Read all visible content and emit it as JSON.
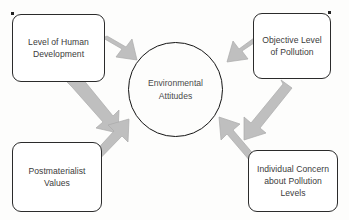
{
  "diagram": {
    "type": "influence-diagram",
    "center": {
      "id": "environmental-attitudes",
      "label": "Environmental\nAttitudes",
      "shape": "circle"
    },
    "nodes": [
      {
        "id": "human-development",
        "label": "Level of Human\nDevelopment",
        "shape": "rounded-rect",
        "position": "top-left"
      },
      {
        "id": "objective-pollution",
        "label": "Objective Level\nof Pollution",
        "shape": "rounded-rect",
        "position": "top-right"
      },
      {
        "id": "postmaterialist",
        "label": "Postmaterialist\nValues",
        "shape": "rounded-rect",
        "position": "bottom-left"
      },
      {
        "id": "individual-concern",
        "label": "Individual Concern\nabout Pollution\nLevels",
        "shape": "rounded-rect",
        "position": "bottom-right"
      }
    ],
    "arrows": [
      {
        "from": "human-development",
        "to": "environmental-attitudes",
        "direction": "down-right"
      },
      {
        "from": "human-development",
        "to": "postmaterialist-path",
        "direction": "down-right"
      },
      {
        "from": "postmaterialist",
        "to": "environmental-attitudes",
        "direction": "up-right"
      },
      {
        "from": "objective-pollution",
        "to": "environmental-attitudes",
        "direction": "down-left"
      },
      {
        "from": "objective-pollution",
        "to": "individual-concern",
        "direction": "down-left"
      },
      {
        "from": "individual-concern",
        "to": "environmental-attitudes",
        "direction": "up-left"
      }
    ],
    "colors": {
      "background": "#fdfdfc",
      "box_fill": "#ffffff",
      "box_border": "#2b2b2b",
      "circle_border": "#141414",
      "text": "#3b3b3b",
      "arrow_fill": "#bfbfbf",
      "arrow_stroke": "#ababab"
    }
  }
}
